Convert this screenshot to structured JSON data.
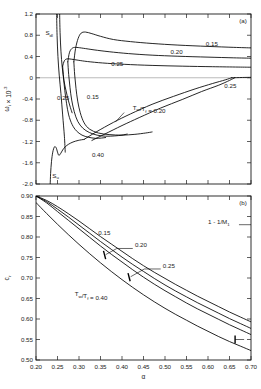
{
  "figure": {
    "panel_a_label": "(a)",
    "panel_b_label": "(b)"
  },
  "chart_data": [
    {
      "type": "line",
      "panel": "(a)",
      "title": "",
      "xlabel": "",
      "ylabel": "w_i x 10^-3",
      "ylabel_base": "ω",
      "ylabel_sub": "i",
      "ylabel_mid": " × 10",
      "ylabel_sup": "-3",
      "xlim": [
        0.2,
        0.7
      ],
      "ylim": [
        -2.0,
        1.2
      ],
      "xticks": [
        0.2,
        0.25,
        0.3,
        0.35,
        0.4,
        0.45,
        0.5,
        0.55,
        0.6,
        0.65,
        0.7
      ],
      "xticklabels": [
        "",
        "",
        "",
        "",
        "",
        "",
        "",
        "",
        "",
        "",
        ""
      ],
      "yticks": [
        -2.0,
        -1.6,
        -1.2,
        -0.8,
        -0.4,
        0,
        0.4,
        0.8,
        1.2
      ],
      "yticklabels": [
        "-2.0",
        "-1.6",
        "-1.2",
        "-0.8",
        "-0.4",
        "0",
        "0.4",
        "0.8",
        "1.2"
      ],
      "grid": false,
      "legend": "none",
      "annotations": [
        {
          "name": "s-dl-label",
          "text": "S",
          "sub": "dl",
          "x": 0.222,
          "y": 0.8
        },
        {
          "name": "s-u-label",
          "text": "S",
          "sub": "u",
          "x": 0.238,
          "y": -1.88
        },
        {
          "name": "upper-015-label",
          "text": "0.15",
          "x": 0.595,
          "y": 0.6
        },
        {
          "name": "upper-020-label",
          "text": "0.20",
          "x": 0.513,
          "y": 0.44
        },
        {
          "name": "upper-025-label",
          "text": "0.25",
          "x": 0.375,
          "y": 0.22
        },
        {
          "name": "left-025-label",
          "text": "0.25",
          "x": 0.249,
          "y": -0.42
        },
        {
          "name": "mid-015-label",
          "text": "0.15",
          "x": 0.318,
          "y": -0.4
        },
        {
          "name": "lower-040-label",
          "text": "0.40",
          "x": 0.33,
          "y": -1.5
        },
        {
          "name": "ratio-label",
          "text": "T",
          "sub": "w",
          "text2": "/T",
          "sub2": "f",
          "text3": " = 0.20",
          "x": 0.425,
          "y": -0.6
        },
        {
          "name": "right-025-label",
          "text": "0.25",
          "x": 0.638,
          "y": -0.2
        }
      ],
      "series": [
        {
          "name": "upper-branch-0.15",
          "label": "0.15",
          "x": [
            0.288,
            0.292,
            0.298,
            0.305,
            0.315,
            0.33,
            0.35,
            0.38,
            0.42,
            0.47,
            0.53,
            0.6,
            0.66,
            0.7
          ],
          "y": [
            0.3,
            0.55,
            0.74,
            0.84,
            0.86,
            0.83,
            0.78,
            0.72,
            0.68,
            0.645,
            0.615,
            0.59,
            0.572,
            0.562
          ]
        },
        {
          "name": "upper-branch-0.20",
          "label": "0.20",
          "x": [
            0.274,
            0.278,
            0.285,
            0.295,
            0.31,
            0.335,
            0.37,
            0.415,
            0.47,
            0.53,
            0.6,
            0.66,
            0.7
          ],
          "y": [
            0.3,
            0.48,
            0.56,
            0.57,
            0.555,
            0.525,
            0.49,
            0.455,
            0.425,
            0.405,
            0.388,
            0.375,
            0.368
          ]
        },
        {
          "name": "upper-branch-0.25",
          "label": "0.25",
          "x": [
            0.262,
            0.266,
            0.272,
            0.282,
            0.298,
            0.32,
            0.355,
            0.405,
            0.47,
            0.54,
            0.61,
            0.67,
            0.7
          ],
          "y": [
            0.22,
            0.32,
            0.355,
            0.35,
            0.33,
            0.305,
            0.278,
            0.253,
            0.232,
            0.218,
            0.208,
            0.201,
            0.198
          ]
        },
        {
          "name": "descending-branch-0.15",
          "label": "0.15",
          "x": [
            0.288,
            0.29,
            0.293,
            0.297,
            0.303,
            0.312,
            0.325,
            0.345,
            0.37,
            0.4,
            0.43,
            0.455,
            0.47
          ],
          "y": [
            0.3,
            0.05,
            -0.2,
            -0.44,
            -0.66,
            -0.85,
            -0.97,
            -1.04,
            -1.07,
            -1.08,
            -1.065,
            -1.04,
            -1.02
          ]
        },
        {
          "name": "descending-branch-0.20",
          "label": "0.20",
          "x": [
            0.274,
            0.276,
            0.279,
            0.283,
            0.289,
            0.297,
            0.309,
            0.324,
            0.342,
            0.362,
            0.383,
            0.4,
            0.412
          ],
          "y": [
            0.3,
            0.06,
            -0.18,
            -0.42,
            -0.64,
            -0.82,
            -0.95,
            -1.03,
            -1.08,
            -1.1,
            -1.095,
            -1.08,
            -1.06
          ]
        },
        {
          "name": "descending-branch-0.25",
          "label": "0.25",
          "x": [
            0.262,
            0.264,
            0.267,
            0.271,
            0.276,
            0.284,
            0.294,
            0.307,
            0.322,
            0.338,
            0.352,
            0.362
          ],
          "y": [
            0.22,
            0.0,
            -0.24,
            -0.48,
            -0.7,
            -0.88,
            -1.0,
            -1.08,
            -1.12,
            -1.14,
            -1.135,
            -1.125
          ]
        },
        {
          "name": "left-vertical-0.25",
          "label": "0.25",
          "x": [
            0.248,
            0.249,
            0.251,
            0.254,
            0.258,
            0.262,
            0.266,
            0.268
          ],
          "y": [
            1.2,
            0.8,
            0.4,
            0.05,
            -0.3,
            -0.7,
            -1.1,
            -1.4
          ]
        },
        {
          "name": "left-steep-branch",
          "label": "",
          "x": [
            0.255,
            0.256,
            0.258,
            0.261,
            0.265,
            0.27,
            0.275,
            0.28,
            0.284
          ],
          "y": [
            1.2,
            0.85,
            0.5,
            0.2,
            -0.05,
            -0.25,
            -0.42,
            -0.56,
            -0.66
          ]
        },
        {
          "name": "s-u-rise-curve",
          "label": "",
          "x": [
            0.233,
            0.234,
            0.236,
            0.239,
            0.243,
            0.247,
            0.25,
            0.253,
            0.257,
            0.262,
            0.268,
            0.276,
            0.286,
            0.298,
            0.312
          ],
          "y": [
            -2.0,
            -1.8,
            -1.58,
            -1.4,
            -1.3,
            -1.32,
            -1.4,
            -1.46,
            -1.43,
            -1.36,
            -1.3,
            -1.25,
            -1.21,
            -1.18,
            -1.16
          ]
        },
        {
          "name": "lower-rising-to-zero-upper",
          "label": "",
          "x": [
            0.312,
            0.34,
            0.38,
            0.42,
            0.47,
            0.52,
            0.57,
            0.61,
            0.64,
            0.655
          ],
          "y": [
            -1.16,
            -1.02,
            -0.84,
            -0.68,
            -0.5,
            -0.35,
            -0.21,
            -0.11,
            -0.04,
            0.0
          ]
        },
        {
          "name": "lower-rising-to-zero-lower",
          "label": "",
          "x": [
            0.33,
            0.36,
            0.4,
            0.44,
            0.49,
            0.54,
            0.585,
            0.625,
            0.65,
            0.662
          ],
          "y": [
            -1.18,
            -1.06,
            -0.9,
            -0.75,
            -0.57,
            -0.41,
            -0.26,
            -0.14,
            -0.05,
            0.0
          ]
        },
        {
          "name": "near-zero-flat-tail",
          "label": "",
          "x": [
            0.655,
            0.68,
            0.7
          ],
          "y": [
            0.0,
            0.005,
            0.008
          ]
        }
      ]
    },
    {
      "type": "line",
      "panel": "(b)",
      "title": "",
      "xlabel": "α",
      "ylabel": "c",
      "ylabel_sub": "r",
      "xlim": [
        0.2,
        0.7
      ],
      "ylim": [
        0.5,
        0.9
      ],
      "xticks": [
        0.2,
        0.25,
        0.3,
        0.35,
        0.4,
        0.45,
        0.5,
        0.55,
        0.6,
        0.65,
        0.7
      ],
      "xticklabels": [
        "0.20",
        "0.25",
        "0.30",
        "0.35",
        "0.40",
        "0.45",
        "0.50",
        "0.55",
        "0.60",
        "0.65",
        "0.70"
      ],
      "yticks": [
        0.5,
        0.55,
        0.6,
        0.65,
        0.7,
        0.75,
        0.8,
        0.85,
        0.9
      ],
      "yticklabels": [
        "0.50",
        "0.55",
        "0.60",
        "0.65",
        "0.70",
        "0.75",
        "0.80",
        "0.85",
        "0.90"
      ],
      "grid": false,
      "legend": "none",
      "annotations": [
        {
          "name": "curve-015-label",
          "text": "0.15",
          "x": 0.345,
          "y": 0.805
        },
        {
          "name": "curve-020-label",
          "text": "0.20",
          "x": 0.43,
          "y": 0.775
        },
        {
          "name": "curve-025-label",
          "text": "0.25",
          "x": 0.495,
          "y": 0.725
        },
        {
          "name": "ratio-040-label",
          "text": "T",
          "sub": "w",
          "text2": "/T",
          "sub2": "f",
          "text3": " = 0.40",
          "x": 0.29,
          "y": 0.655
        },
        {
          "name": "limit-label",
          "text": "1 - 1/M",
          "sub": "1",
          "x": 0.6,
          "y": 0.832
        }
      ],
      "series": [
        {
          "name": "c-r-curve-0.15",
          "label": "0.15",
          "x": [
            0.2,
            0.225,
            0.25,
            0.275,
            0.3,
            0.325,
            0.35,
            0.375,
            0.4,
            0.425,
            0.45,
            0.475,
            0.5,
            0.525,
            0.55,
            0.575,
            0.6,
            0.625,
            0.65,
            0.675,
            0.7
          ],
          "y": [
            0.9,
            0.889,
            0.874,
            0.857,
            0.839,
            0.82,
            0.801,
            0.783,
            0.765,
            0.747,
            0.73,
            0.714,
            0.699,
            0.684,
            0.67,
            0.656,
            0.643,
            0.63,
            0.617,
            0.605,
            0.593
          ]
        },
        {
          "name": "c-r-curve-0.20",
          "label": "0.20",
          "x": [
            0.2,
            0.225,
            0.25,
            0.275,
            0.3,
            0.325,
            0.35,
            0.375,
            0.4,
            0.425,
            0.45,
            0.475,
            0.5,
            0.525,
            0.55,
            0.575,
            0.6,
            0.625,
            0.65,
            0.675,
            0.7
          ],
          "y": [
            0.9,
            0.886,
            0.868,
            0.849,
            0.829,
            0.809,
            0.789,
            0.77,
            0.751,
            0.733,
            0.716,
            0.699,
            0.683,
            0.668,
            0.654,
            0.64,
            0.627,
            0.614,
            0.601,
            0.589,
            0.577
          ]
        },
        {
          "name": "c-r-curve-0.25",
          "label": "0.25",
          "x": [
            0.2,
            0.225,
            0.25,
            0.275,
            0.3,
            0.325,
            0.35,
            0.375,
            0.4,
            0.425,
            0.45,
            0.475,
            0.5,
            0.525,
            0.55,
            0.575,
            0.6,
            0.625,
            0.65,
            0.675,
            0.7
          ],
          "y": [
            0.9,
            0.883,
            0.862,
            0.841,
            0.82,
            0.799,
            0.778,
            0.758,
            0.739,
            0.72,
            0.702,
            0.685,
            0.669,
            0.654,
            0.639,
            0.625,
            0.612,
            0.599,
            0.586,
            0.574,
            0.562
          ]
        },
        {
          "name": "c-r-curve-0.40",
          "label": "0.40",
          "x": [
            0.2,
            0.225,
            0.25,
            0.275,
            0.3,
            0.325,
            0.35,
            0.375,
            0.4,
            0.425,
            0.45,
            0.475,
            0.5,
            0.525,
            0.55,
            0.575,
            0.6,
            0.625,
            0.65,
            0.675,
            0.7
          ],
          "y": [
            0.884,
            0.857,
            0.831,
            0.806,
            0.782,
            0.759,
            0.737,
            0.716,
            0.696,
            0.677,
            0.659,
            0.642,
            0.626,
            0.611,
            0.597,
            0.583,
            0.57,
            0.557,
            0.545,
            0.534,
            0.523
          ]
        }
      ]
    }
  ]
}
